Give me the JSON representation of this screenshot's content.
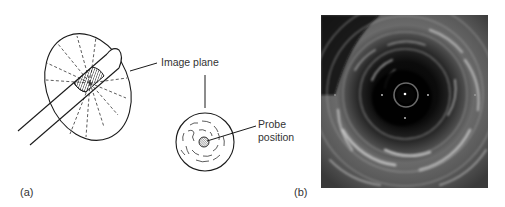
{
  "figure": {
    "panel_a": {
      "label": "(a)",
      "annotations": {
        "image_plane": "Image plane",
        "probe_line1": "Probe",
        "probe_line2": "position"
      }
    },
    "panel_b": {
      "label": "(b)",
      "image_description": "Intravascular ultrasound cross-sectional image"
    },
    "colors": {
      "line": "#1a1a1a",
      "text": "#333333",
      "ultrasound_bg": "#0a0a0a"
    }
  }
}
